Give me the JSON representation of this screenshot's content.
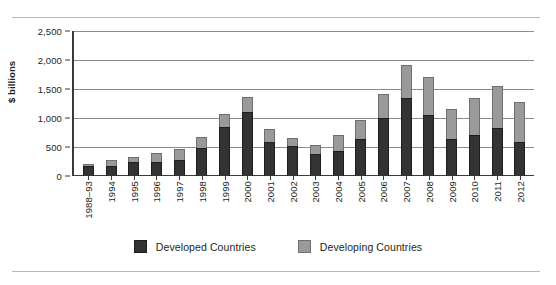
{
  "chart_data": {
    "type": "bar",
    "stacked": true,
    "title": "",
    "xlabel": "",
    "ylabel": "$ billions",
    "ylim": [
      0,
      2500
    ],
    "ytick_labels": [
      "0",
      "500",
      "1,000",
      "1,500",
      "2,000",
      "2,500"
    ],
    "ytick_values": [
      0,
      500,
      1000,
      1500,
      2000,
      2500
    ],
    "grid": "horizontal",
    "legend_position": "bottom-center",
    "categories": [
      "1988–93",
      "1994",
      "1995",
      "1996",
      "1997",
      "1998",
      "1999",
      "2000",
      "2001",
      "2002",
      "2003",
      "2004",
      "2005",
      "2006",
      "2007",
      "2008",
      "2009",
      "2010",
      "2011",
      "2012"
    ],
    "series": [
      {
        "name": "Developed Countries",
        "color": "#333333",
        "values": [
          170,
          175,
          235,
          240,
          280,
          480,
          840,
          1110,
          580,
          510,
          380,
          430,
          640,
          1000,
          1340,
          1050,
          630,
          710,
          830,
          580
        ]
      },
      {
        "name": "Developing Countries",
        "color": "#9A9A9A",
        "values": [
          40,
          95,
          95,
          150,
          185,
          200,
          230,
          260,
          225,
          145,
          160,
          280,
          320,
          410,
          570,
          650,
          520,
          640,
          720,
          690
        ]
      }
    ],
    "totals": [
      210,
      270,
      330,
      390,
      465,
      680,
      1070,
      1370,
      805,
      655,
      540,
      710,
      960,
      1410,
      1910,
      1700,
      1150,
      1350,
      1550,
      1270
    ]
  },
  "legend": {
    "items": [
      {
        "label": "Developed Countries",
        "swatch": "developed"
      },
      {
        "label": "Developing Countries",
        "swatch": "developing"
      }
    ]
  }
}
